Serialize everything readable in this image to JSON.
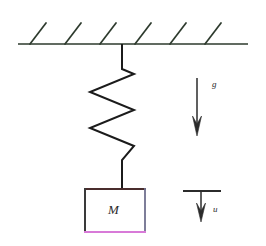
{
  "figure": {
    "background_color": "#ffffff",
    "width": 266,
    "height": 246
  },
  "ceiling": {
    "name": "fixed-support",
    "line_color": "#2d3a2d",
    "line_width": 1.6,
    "x_start": 18,
    "x_end": 248,
    "y": 44,
    "hatch_count": 6,
    "hatch_color": "#2d3a2d",
    "hatch_length": 26,
    "hatch_angle_deg": -52,
    "hatch_x_positions": [
      30,
      65,
      100,
      135,
      170,
      205
    ]
  },
  "spring": {
    "name": "spring-zigzag",
    "stroke_color": "#1b1b1b",
    "stroke_width": 2.0,
    "attach_x": 122,
    "top_y": 44,
    "coil_top_y": 68,
    "coil_bottom_y": 160,
    "bottom_y": 189,
    "left_x": 90,
    "right_x": 134,
    "coil_count": 4,
    "path": "M122,44 L122,68 L134,74 L90,92 L134,110 L90,128 L134,146 L122,160 L122,189"
  },
  "mass_box": {
    "name": "mass-block",
    "label": "M",
    "x": 84,
    "y": 188,
    "width": 62,
    "height": 45,
    "fill": "#ffffff",
    "top_border_color": "#4a2d2d",
    "left_border_color": "#3a3a3a",
    "right_border_color": "#6a6a8a",
    "bottom_border_color": "#d87ad8",
    "border_width": 2
  },
  "arrows": [
    {
      "name": "gravity-arrow",
      "label": "g",
      "x": 197,
      "y_start": 78,
      "y_end": 136,
      "color": "#2b2b2b",
      "stroke_width": 1.4,
      "head_width": 9,
      "head_length": 20,
      "has_cap_bar": false,
      "direction": "down"
    },
    {
      "name": "displacement-arrow",
      "label": "u",
      "x": 201,
      "y_start": 191,
      "y_end": 222,
      "color": "#2b2b2b",
      "stroke_width": 1.4,
      "head_width": 9,
      "head_length": 18,
      "has_cap_bar": true,
      "cap_bar_x_start": 183,
      "cap_bar_x_end": 220,
      "cap_bar_y": 191,
      "direction": "down"
    }
  ],
  "labels": {
    "gravity": "g",
    "displacement": "u",
    "mass": "M"
  }
}
